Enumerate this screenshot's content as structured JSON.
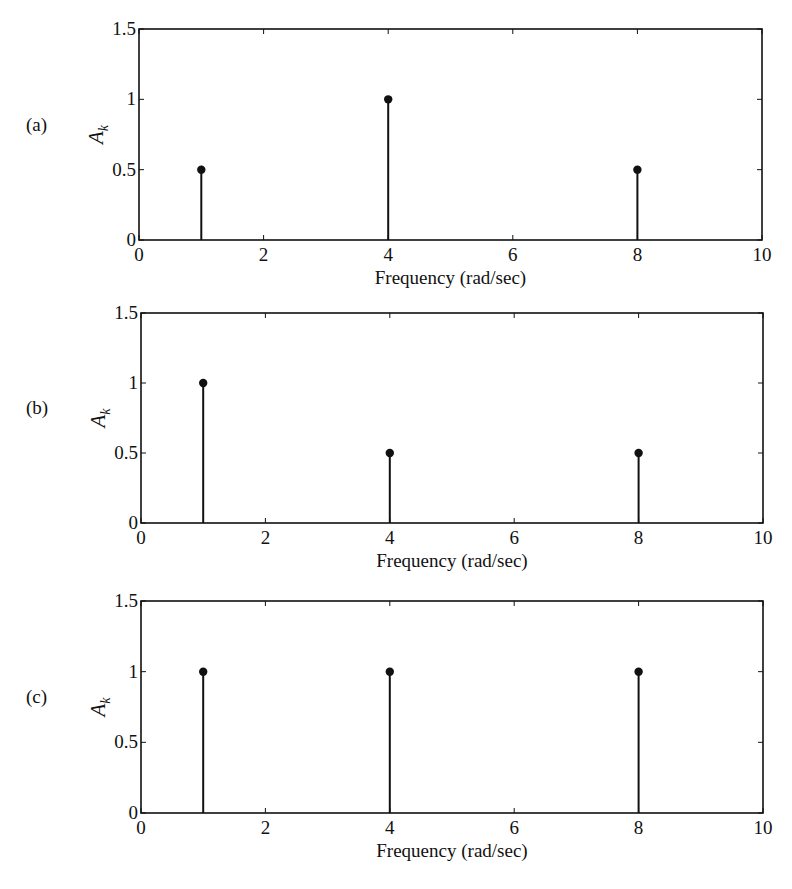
{
  "figure": {
    "panels": [
      {
        "label": "(a)",
        "ylabel": "A",
        "ylabel_sub": "k",
        "xlabel": "Frequency (rad/sec)"
      },
      {
        "label": "(b)",
        "ylabel": "A",
        "ylabel_sub": "k",
        "xlabel": "Frequency (rad/sec)"
      },
      {
        "label": "(c)",
        "ylabel": "A",
        "ylabel_sub": "k",
        "xlabel": "Frequency (rad/sec)"
      }
    ],
    "colors": {
      "line": "#111111",
      "marker": "#111111",
      "background": "#ffffff"
    }
  },
  "chart_data": [
    {
      "type": "stem",
      "panel_label": "(a)",
      "title": "",
      "xlabel": "Frequency (rad/sec)",
      "ylabel": "A_k",
      "x": [
        1,
        4,
        8
      ],
      "values": [
        0.5,
        1,
        0.5
      ],
      "xlim": [
        0,
        10
      ],
      "ylim": [
        0,
        1.5
      ],
      "xticks": [
        "0",
        "2",
        "4",
        "6",
        "8",
        "10"
      ],
      "yticks": [
        "0",
        "0.5",
        "1",
        "1.5"
      ],
      "grid": false,
      "legend": null
    },
    {
      "type": "stem",
      "panel_label": "(b)",
      "title": "",
      "xlabel": "Frequency (rad/sec)",
      "ylabel": "A_k",
      "x": [
        1,
        4,
        8
      ],
      "values": [
        1,
        0.5,
        0.5
      ],
      "xlim": [
        0,
        10
      ],
      "ylim": [
        0,
        1.5
      ],
      "xticks": [
        "0",
        "2",
        "4",
        "6",
        "8",
        "10"
      ],
      "yticks": [
        "0",
        "0.5",
        "1",
        "1.5"
      ],
      "grid": false,
      "legend": null
    },
    {
      "type": "stem",
      "panel_label": "(c)",
      "title": "",
      "xlabel": "Frequency (rad/sec)",
      "ylabel": "A_k",
      "x": [
        1,
        4,
        8
      ],
      "values": [
        1,
        1,
        1
      ],
      "xlim": [
        0,
        10
      ],
      "ylim": [
        0,
        1.5
      ],
      "xticks": [
        "0",
        "2",
        "4",
        "6",
        "8",
        "10"
      ],
      "yticks": [
        "0",
        "0.5",
        "1",
        "1.5"
      ],
      "grid": false,
      "legend": null
    }
  ]
}
